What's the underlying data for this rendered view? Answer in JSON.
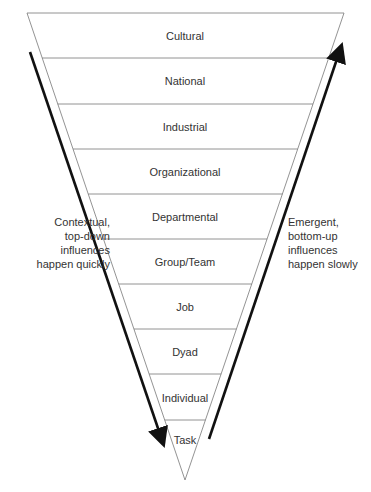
{
  "diagram": {
    "type": "inverted-triangle",
    "levels": [
      {
        "label": "Cultural"
      },
      {
        "label": "National"
      },
      {
        "label": "Industrial"
      },
      {
        "label": "Organizational"
      },
      {
        "label": "Departmental"
      },
      {
        "label": "Group/Team"
      },
      {
        "label": "Job"
      },
      {
        "label": "Dyad"
      },
      {
        "label": "Individual"
      },
      {
        "label": "Task"
      }
    ],
    "left_annotation": {
      "direction": "down",
      "lines": [
        "Contextual,",
        "top-down",
        "influences",
        "happen quickly"
      ]
    },
    "right_annotation": {
      "direction": "up",
      "lines": [
        "Emergent,",
        "bottom-up",
        "influences",
        "happen slowly"
      ]
    },
    "colors": {
      "outline": "#777777",
      "arrow": "#111111",
      "text": "#333333"
    }
  }
}
